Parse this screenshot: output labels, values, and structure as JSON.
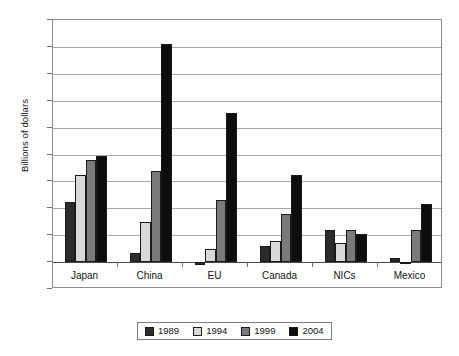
{
  "chart_data": {
    "type": "bar",
    "title": "",
    "subtitle": "",
    "xlabel": "",
    "ylabel": "Billions of dollars",
    "ylim": [
      -20,
      180
    ],
    "ytick_step": 20,
    "yticks": [
      180,
      160,
      140,
      120,
      100,
      80,
      60,
      40,
      20,
      0,
      -20
    ],
    "ytick_labels": [
      "180",
      "160",
      "140",
      "120",
      "100",
      "80",
      "60",
      "40",
      "20",
      "0",
      "-20"
    ],
    "grid": "horizontal",
    "legend_position": "bottom",
    "categories": [
      "Japan",
      "China",
      "EU",
      "Canada",
      "NICs",
      "Mexico"
    ],
    "series": [
      {
        "name": "1989",
        "color": "#2b2b2b",
        "values": [
          45,
          7,
          -2,
          12,
          24,
          3
        ]
      },
      {
        "name": "1994",
        "color": "#d9d9d9",
        "values": [
          65,
          30,
          10,
          16,
          14,
          -1
        ]
      },
      {
        "name": "1999",
        "color": "#7a7a7a",
        "values": [
          76,
          68,
          46,
          36,
          24,
          24
        ]
      },
      {
        "name": "2004",
        "color": "#0d0d0d",
        "values": [
          79,
          162,
          111,
          65,
          21,
          43
        ]
      }
    ]
  },
  "legend": {
    "items": [
      {
        "label": "1989",
        "color": "#2b2b2b"
      },
      {
        "label": "1994",
        "color": "#d9d9d9"
      },
      {
        "label": "1999",
        "color": "#7a7a7a"
      },
      {
        "label": "2004",
        "color": "#0d0d0d"
      }
    ]
  },
  "axis": {
    "y_title": "Billions of dollars"
  }
}
